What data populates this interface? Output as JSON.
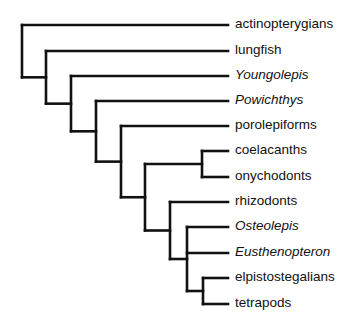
{
  "diagram": {
    "type": "cladogram",
    "line_color": "#111111",
    "tip_x": 228,
    "taxa": [
      {
        "name": "actinopterygians",
        "italic": false,
        "y": 25
      },
      {
        "name": "lungfish",
        "italic": false,
        "y": 51
      },
      {
        "name": "Youngolepis",
        "italic": true,
        "y": 76
      },
      {
        "name": "Powichthys",
        "italic": true,
        "y": 101
      },
      {
        "name": "porolepiforms",
        "italic": false,
        "y": 126
      },
      {
        "name": "coelacanths",
        "italic": false,
        "y": 151
      },
      {
        "name": "onychodonts",
        "italic": false,
        "y": 177
      },
      {
        "name": "rhizodonts",
        "italic": false,
        "y": 202
      },
      {
        "name": "Osteolepis",
        "italic": true,
        "y": 227
      },
      {
        "name": "Eusthenopteron",
        "italic": true,
        "y": 253
      },
      {
        "name": "elpistostegalians",
        "italic": false,
        "y": 278
      },
      {
        "name": "tetrapods",
        "italic": false,
        "y": 304
      }
    ],
    "nodes": [
      {
        "id": "n1",
        "x": 22,
        "children": [
          "t0",
          "n2"
        ]
      },
      {
        "id": "n2",
        "x": 46,
        "children": [
          "t1",
          "n3"
        ]
      },
      {
        "id": "n3",
        "x": 71,
        "children": [
          "t2",
          "n4"
        ]
      },
      {
        "id": "n4",
        "x": 96,
        "children": [
          "t3",
          "n5"
        ]
      },
      {
        "id": "n5",
        "x": 121,
        "children": [
          "t4",
          "n6"
        ]
      },
      {
        "id": "n6",
        "x": 145,
        "children": [
          "n7",
          "n8"
        ]
      },
      {
        "id": "n7",
        "x": 202,
        "children": [
          "t5",
          "t6"
        ]
      },
      {
        "id": "n8",
        "x": 170,
        "children": [
          "t7",
          "n9"
        ]
      },
      {
        "id": "n9",
        "x": 187,
        "children": [
          "t8",
          "t9",
          "n10"
        ]
      },
      {
        "id": "n10",
        "x": 203,
        "children": [
          "t10",
          "t11"
        ]
      }
    ]
  }
}
